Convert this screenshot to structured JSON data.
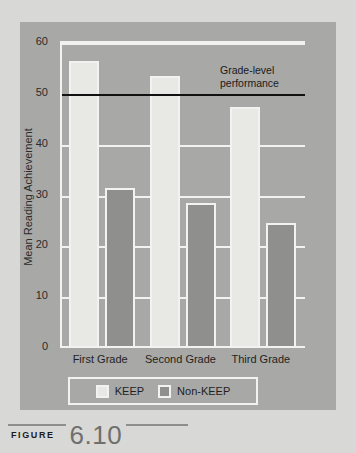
{
  "figure": {
    "label": "FIGURE",
    "number": "6.10"
  },
  "chart_data": {
    "type": "bar",
    "title": "",
    "xlabel": "",
    "ylabel": "Mean Reading Achievement",
    "ylim": [
      0,
      60
    ],
    "yticks": [
      0,
      10,
      20,
      30,
      40,
      50,
      60
    ],
    "ytick_labels": [
      "0",
      "10",
      "20",
      "30",
      "40",
      "50",
      "60"
    ],
    "grid": true,
    "grid_axis": "y",
    "legend_position": "bottom",
    "categories": [
      "First Grade",
      "Second Grade",
      "Third Grade"
    ],
    "series": [
      {
        "name": "KEEP",
        "color": "#e8e8e4",
        "values": [
          56.5,
          53.5,
          47.5
        ]
      },
      {
        "name": "Non-KEEP",
        "color": "#8f8f8d",
        "values": [
          31.5,
          28.5,
          24.5
        ]
      }
    ],
    "annotations": [
      {
        "name": "grade-level-reference-line",
        "type": "hline",
        "value": 50,
        "color": "#111111",
        "label_line1": "Grade-level",
        "label_line2": "performance"
      }
    ]
  },
  "colors": {
    "page_background": "#d8d8d6",
    "panel_background": "#a8a8a6",
    "gridline": "#f2f2f0",
    "text": "#1f1f1f"
  }
}
